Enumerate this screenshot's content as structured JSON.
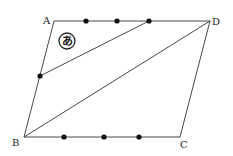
{
  "diagram": {
    "type": "geometry-parallelogram",
    "vertices": {
      "A": {
        "label": "A",
        "x": 54,
        "y": 21
      },
      "B": {
        "label": "B",
        "x": 24,
        "y": 137
      },
      "C": {
        "label": "C",
        "x": 180,
        "y": 137
      },
      "D": {
        "label": "D",
        "x": 210,
        "y": 21
      }
    },
    "segments": [
      {
        "from": "A",
        "to": "D"
      },
      {
        "from": "D",
        "to": "C"
      },
      {
        "from": "C",
        "to": "B"
      },
      {
        "from": "B",
        "to": "A"
      },
      {
        "from": "B",
        "to": "D"
      },
      {
        "from": "P_AB",
        "to": "P_AD3"
      }
    ],
    "points_on_AD": [
      {
        "x": 86,
        "y": 21
      },
      {
        "x": 117,
        "y": 21
      },
      {
        "x": 149,
        "y": 21
      }
    ],
    "points_on_BC": [
      {
        "x": 64,
        "y": 137
      },
      {
        "x": 104,
        "y": 137
      },
      {
        "x": 139,
        "y": 137
      }
    ],
    "point_on_AB": {
      "x": 40,
      "y": 76
    },
    "region_marker": {
      "symbol": "あ",
      "x": 67,
      "y": 41,
      "r": 8
    },
    "colors": {
      "stroke": "#333333",
      "dot": "#111111",
      "background": "#ffffff"
    }
  }
}
